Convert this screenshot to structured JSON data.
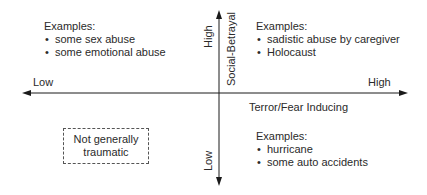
{
  "diagram": {
    "type": "quadrant",
    "x_axis": {
      "name": "Terror/Fear Inducing",
      "low_label": "Low",
      "high_label": "High"
    },
    "y_axis": {
      "name": "Social-Betrayal",
      "low_label": "Low",
      "high_label": "High"
    },
    "quadrants": {
      "top_left": {
        "heading": "Examples:",
        "items": [
          "some sex abuse",
          "some emotional abuse"
        ]
      },
      "top_right": {
        "heading": "Examples:",
        "items": [
          "sadistic abuse by caregiver",
          "Holocaust"
        ]
      },
      "bottom_right": {
        "heading": "Examples:",
        "items": [
          "hurricane",
          "some auto accidents"
        ]
      },
      "bottom_left": {
        "box_line1": "Not generally",
        "box_line2": "traumatic"
      }
    },
    "colors": {
      "line": "#1a1a1a",
      "text": "#2a2a2a",
      "background": "#ffffff"
    }
  }
}
